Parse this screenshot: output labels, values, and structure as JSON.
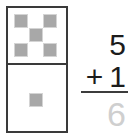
{
  "domino": {
    "label": "domino-tile",
    "top_cell": {
      "pip_count": 5,
      "arrangement": "quincunx"
    },
    "bottom_cell": {
      "pip_count": 1,
      "arrangement": "center"
    },
    "colors": {
      "border": "#3a3a3a",
      "pip": "#a8a8a8",
      "face": "#ffffff"
    }
  },
  "sum": {
    "addend_1": "5",
    "operator": "+",
    "addend_2": "1",
    "answer": "6",
    "colors": {
      "digits": "#1c1c1c",
      "rule": "#3c3c3c",
      "answer": "#cfcfcf"
    }
  }
}
